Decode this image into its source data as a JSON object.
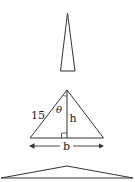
{
  "diagram": {
    "stroke_color": "#333333",
    "top_triangle": {
      "apex": [
        67.5,
        13
      ],
      "base_left": [
        60.5,
        71
      ],
      "base_right": [
        75,
        71
      ]
    },
    "middle_triangle": {
      "apex": [
        67,
        90
      ],
      "base_left": [
        30,
        138
      ],
      "base_right": [
        103.5,
        138
      ],
      "side_label": "15",
      "angle_label": "θ",
      "height_label": "h",
      "base_label": "b",
      "right_angle_marker": true,
      "base_arrow": true
    },
    "bottom_triangle": {
      "apex": [
        67,
        166
      ],
      "base_left": [
        1,
        178
      ],
      "base_right": [
        133,
        178
      ]
    }
  }
}
